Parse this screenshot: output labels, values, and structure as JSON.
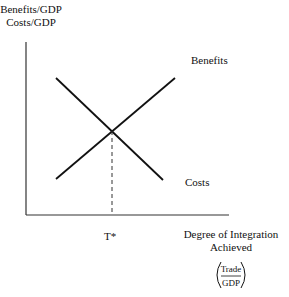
{
  "diagram": {
    "y_axis_label_line1": "Benefits/GDP",
    "y_axis_label_line2": "Costs/GDP",
    "x_axis_label_line1": "Degree of Integration",
    "x_axis_label_line2": "Achieved",
    "fraction_numerator": "Trade",
    "fraction_denominator": "GDP",
    "benefits_label": "Benefits",
    "costs_label": "Costs",
    "intersection_label": "T*"
  }
}
